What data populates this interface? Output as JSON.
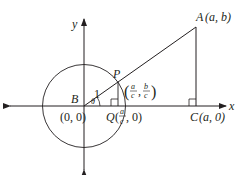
{
  "diagram": {
    "axes": {
      "x_label": "x",
      "y_label": "y"
    },
    "points": {
      "B": {
        "name": "B",
        "coord": "(0, 0)"
      },
      "P": {
        "name": "P"
      },
      "P_coord": {
        "open": "(",
        "x_num": "a",
        "x_den": "c",
        "sep": ",",
        "y_num": "b",
        "y_den": "c",
        "close": ")"
      },
      "Q": {
        "name": "Q",
        "open": "(",
        "x_num": "a",
        "x_den": "c",
        "rest": ", 0)"
      },
      "A": {
        "name": "A",
        "coord": "(a, b)"
      },
      "C": {
        "name": "C",
        "coord": "(a, 0)"
      }
    },
    "segment_label": "1",
    "angle_label": "θ",
    "circle": {
      "center": "B",
      "radius": "1"
    },
    "colors": {
      "stroke": "#231f20",
      "background": "#ffffff"
    }
  }
}
